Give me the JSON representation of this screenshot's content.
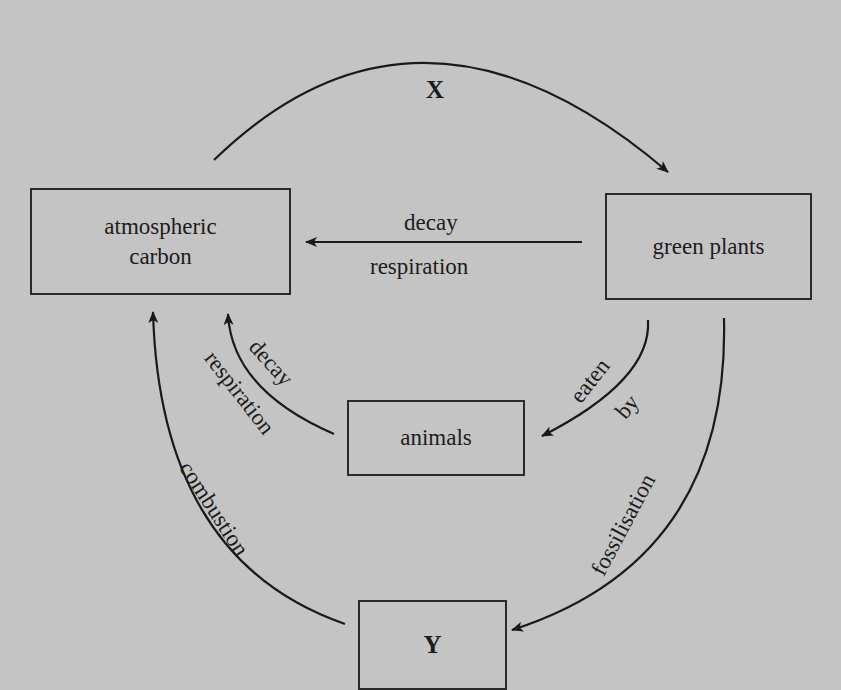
{
  "diagram": {
    "type": "carbon-cycle",
    "colors": {
      "background": "#c4c4c4",
      "ink": "#1c1c1c"
    },
    "nodes": {
      "atmospheric_carbon": {
        "line1": "atmospheric",
        "line2": "carbon"
      },
      "green_plants": {
        "label": "green plants"
      },
      "animals": {
        "label": "animals"
      },
      "y": {
        "label": "Y"
      }
    },
    "arrows": {
      "x": {
        "label": "X",
        "from": "atmospheric carbon",
        "to": "green plants"
      },
      "plants_to_atmosphere": {
        "label_top": "decay",
        "label_bottom": "respiration",
        "from": "green plants",
        "to": "atmospheric carbon"
      },
      "animals_to_atmosphere": {
        "label_inner": "decay",
        "label_outer": "respiration",
        "from": "animals",
        "to": "atmospheric carbon"
      },
      "eaten_by": {
        "label_1": "eaten",
        "label_2": "by",
        "from": "green plants",
        "to": "animals"
      },
      "fossilisation": {
        "label": "fossilisation",
        "from": "green plants",
        "to": "Y"
      },
      "combustion": {
        "label": "combustion",
        "from": "Y",
        "to": "atmospheric carbon"
      }
    }
  }
}
